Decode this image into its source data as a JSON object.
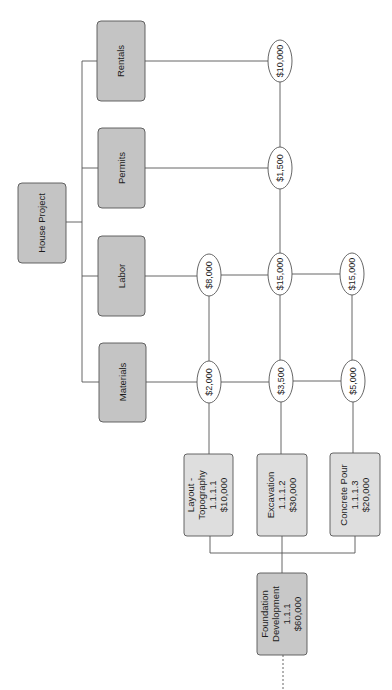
{
  "root": {
    "label": "House Project"
  },
  "categories": [
    {
      "id": "rentals",
      "label": "Rentals"
    },
    {
      "id": "permits",
      "label": "Permits"
    },
    {
      "id": "labor",
      "label": "Labor"
    },
    {
      "id": "materials",
      "label": "Materials"
    }
  ],
  "cost_nodes": {
    "rentals_total": "$10,000",
    "permits_total": "$1,500",
    "labor_layout": "$8,000",
    "labor_excavation": "$15,000",
    "labor_concrete": "$15,000",
    "materials_layout": "$2,000",
    "materials_excavation": "$3,500",
    "materials_concrete": "$5,000"
  },
  "work_packages": [
    {
      "name_line1": "Layout -",
      "name_line2": "Topography",
      "code": "1.1.1.1",
      "cost": "$10,000"
    },
    {
      "name_line1": "Excavation",
      "name_line2": "",
      "code": "1.1.1.2",
      "cost": "$30,000"
    },
    {
      "name_line1": "Concrete Pour",
      "name_line2": "",
      "code": "1.1.1.3",
      "cost": "$20,000"
    }
  ],
  "summary_task": {
    "name_line1": "Foundation",
    "name_line2": "Development",
    "code": "1.1.1",
    "cost": "$60,000"
  },
  "colors": {
    "dark_box": "#c4c4c4",
    "light_box": "#dedede",
    "stroke": "#555555",
    "ellipse_fill": "#ffffff"
  }
}
